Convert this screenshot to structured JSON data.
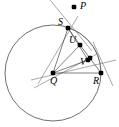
{
  "figure": {
    "type": "geometry-diagram",
    "width": 119,
    "height": 127,
    "background_color": "#ffffff",
    "stroke_color": "#4a4a4a",
    "point_color": "#000000"
  },
  "circle": {
    "name": "circle-centered-at-Q",
    "center_label": "Q",
    "center": {
      "x": 53,
      "y": 73
    },
    "radius": 48
  },
  "points": [
    {
      "id": "P",
      "label": "P",
      "x": 74,
      "y": 7,
      "label_x": 80,
      "label_y": 1,
      "on_circle": false
    },
    {
      "id": "S",
      "label": "S",
      "x": 68,
      "y": 28,
      "label_x": 58,
      "label_y": 17,
      "on_circle": true
    },
    {
      "id": "U",
      "label": "U",
      "x": 80,
      "y": 45,
      "label_x": 69,
      "label_y": 35,
      "on_circle": false
    },
    {
      "id": "W",
      "label": "",
      "x": 90,
      "y": 58,
      "label_x": 0,
      "label_y": 0,
      "on_circle": false
    },
    {
      "id": "V",
      "label": "V",
      "x": 88,
      "y": 60,
      "label_x": 80,
      "label_y": 57,
      "on_circle": false
    },
    {
      "id": "Q",
      "label": "Q",
      "x": 53,
      "y": 73,
      "label_x": 50,
      "label_y": 76,
      "on_circle": false
    },
    {
      "id": "R",
      "label": "R",
      "x": 101,
      "y": 73,
      "label_x": 93,
      "label_y": 76,
      "on_circle": true
    }
  ],
  "segments": [
    {
      "name": "segment-Q-S",
      "from": "Q",
      "to": "S"
    },
    {
      "name": "segment-Q-U",
      "from": "Q",
      "to": "U"
    },
    {
      "name": "segment-Q-V",
      "from": "Q",
      "to": "V"
    },
    {
      "name": "segment-Q-R",
      "from": "Q",
      "to": "R"
    },
    {
      "name": "segment-S-U",
      "from": "S",
      "to": "U"
    },
    {
      "name": "segment-S-V",
      "from": "S",
      "to": "V"
    },
    {
      "name": "segment-U-R",
      "from": "U",
      "to": "R"
    }
  ],
  "rays": [
    {
      "name": "ray-through-S-and-P",
      "x1": 50,
      "y1": 0,
      "x2": 92,
      "y2": 51
    },
    {
      "name": "ray-through-Q-and-R-extended",
      "x1": 31,
      "y1": 80,
      "x2": 116,
      "y2": 60
    },
    {
      "name": "ray-through-Q-upper-left",
      "x1": 38,
      "y1": 84,
      "x2": 78,
      "y2": 16
    },
    {
      "name": "ray-through-R-diagonal",
      "x1": 93,
      "y1": 42,
      "x2": 113,
      "y2": 86
    },
    {
      "name": "ray-through-V-lower-left",
      "x1": 34,
      "y1": 88,
      "x2": 97,
      "y2": 54
    }
  ],
  "arcs": [
    {
      "name": "arc-S-to-R-inner",
      "from": "S",
      "to": "R"
    }
  ]
}
